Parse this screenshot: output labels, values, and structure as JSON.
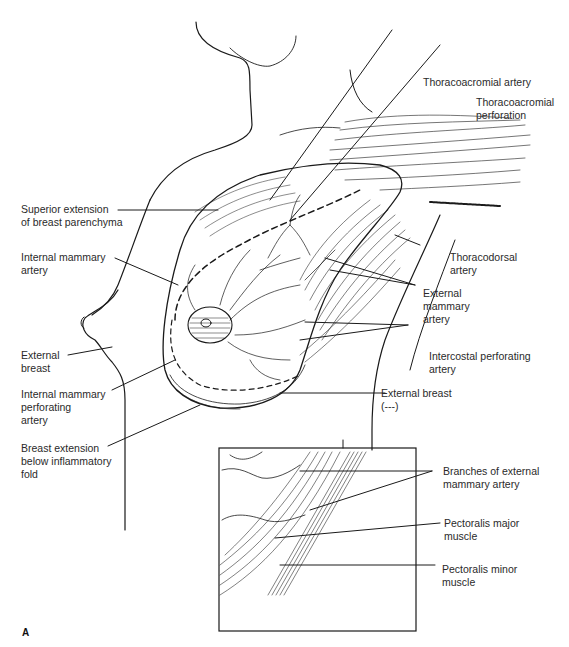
{
  "figure": {
    "panel_letter": "A"
  },
  "labels": {
    "thoracoacromial_artery": "Thoracoacromial artery",
    "thoracoacromial_perforation_1": "Thoracoacromial",
    "thoracoacromial_perforation_2": "perforation",
    "superior_extension_1": "Superior extension",
    "superior_extension_2": "of breast parenchyma",
    "internal_mammary_artery_1": "Internal mammary",
    "internal_mammary_artery_2": "artery",
    "thoracodorsal_artery_1": "Thoracodorsal",
    "thoracodorsal_artery_2": "artery",
    "external_mammary_artery_1": "External",
    "external_mammary_artery_2": "mammary",
    "external_mammary_artery_3": "artery",
    "external_breast_left_1": "External",
    "external_breast_left_2": "breast",
    "intercostal_perforating_1": "Intercostal perforating",
    "intercostal_perforating_2": "artery",
    "internal_mammary_perforating_1": "Internal mammary",
    "internal_mammary_perforating_2": "perforating",
    "internal_mammary_perforating_3": "artery",
    "external_breast_right_1": "External breast",
    "external_breast_right_2": "(---)",
    "breast_extension_1": "Breast extension",
    "breast_extension_2": "below inflammatory",
    "breast_extension_3": "fold",
    "branches_external_mammary_1": "Branches of external",
    "branches_external_mammary_2": "mammary artery",
    "pectoralis_major_1": "Pectoralis major",
    "pectoralis_major_2": "muscle",
    "pectoralis_minor_1": "Pectoralis minor",
    "pectoralis_minor_2": "muscle"
  },
  "colors": {
    "ink": "#1a1a1a",
    "background": "#ffffff"
  }
}
